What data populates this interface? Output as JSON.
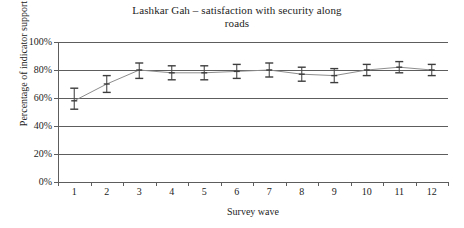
{
  "chart_data": {
    "type": "line",
    "title": "Lashkar Gah – satisfaction with security along roads",
    "title_lines": [
      "Lashkar Gah – satisfaction with security along",
      "roads"
    ],
    "xlabel": "Survey wave",
    "ylabel": "Percentage of indicator support",
    "categories": [
      "1",
      "2",
      "3",
      "4",
      "5",
      "6",
      "7",
      "8",
      "9",
      "10",
      "11",
      "12"
    ],
    "values": [
      58,
      70,
      80,
      78,
      78,
      79,
      80,
      77,
      76,
      80,
      82,
      80
    ],
    "error_low": [
      52,
      64,
      74,
      73,
      73,
      74,
      75,
      72,
      71,
      76,
      78,
      76
    ],
    "error_high": [
      67,
      76,
      85,
      83,
      83,
      84,
      85,
      82,
      81,
      84,
      86,
      84
    ],
    "ylim": [
      0,
      100
    ],
    "ytick_labels": [
      "0%",
      "20%",
      "40%",
      "60%",
      "80%",
      "100%"
    ],
    "ytick_values": [
      0,
      20,
      40,
      60,
      80,
      100
    ],
    "grid": "horizontal",
    "legend": "none",
    "series_name": "satisfaction with security along roads",
    "colors": {
      "line": "#8d8d8d",
      "marker": "#3d3d3d",
      "errorbar": "#4a4a4a",
      "axis": "#5d5d5d",
      "text": "#1c1c1c",
      "background": "#ffffff"
    }
  }
}
